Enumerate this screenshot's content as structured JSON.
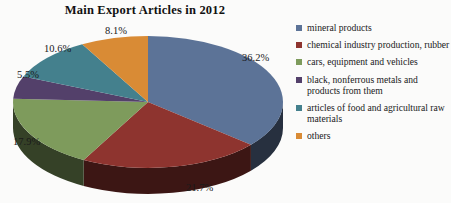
{
  "chart_data": {
    "type": "pie",
    "title": "Main Export Articles in 2012",
    "xlabel": "",
    "ylabel": "",
    "legend_position": "right",
    "three_d": true,
    "categories": [
      "mineral products",
      "chemical industry production, rubber",
      "cars, equipment and vehicles",
      "black, nonferrous metals and products from them",
      "articles of food and agricultural raw materials",
      "others"
    ],
    "values": [
      36.2,
      21.7,
      17.9,
      5.5,
      10.6,
      8.1
    ],
    "value_labels": [
      "36.2%",
      "21.7%",
      "17.9%",
      "5.5%",
      "10.6%",
      "8.1%"
    ],
    "unit": "%",
    "colors": [
      "#5c7397",
      "#8e342f",
      "#7e9b5c",
      "#53406a",
      "#44808d",
      "#d98b35"
    ]
  },
  "title": {
    "text": "Main Export Articles in 2012"
  },
  "legend": {
    "items": [
      {
        "label": "mineral products",
        "color": "#5c7397",
        "value_label": "36.2%"
      },
      {
        "label": "chemical industry production, rubber",
        "color": "#8e342f",
        "value_label": "21.7%"
      },
      {
        "label": "cars, equipment and vehicles",
        "color": "#7e9b5c",
        "value_label": "17.9%"
      },
      {
        "label": "black, nonferrous metals and products from them",
        "color": "#53406a",
        "value_label": "5.5%"
      },
      {
        "label": "articles of food and agricultural raw materials",
        "color": "#44808d",
        "value_label": "10.6%"
      },
      {
        "label": "others",
        "color": "#d98b35",
        "value_label": "8.1%"
      }
    ]
  },
  "slice_labels": [
    {
      "text": "36.2%",
      "x": 242,
      "y": 38
    },
    {
      "text": "21.7%",
      "x": 186,
      "y": 168
    },
    {
      "text": "17.9%",
      "x": 13,
      "y": 122
    },
    {
      "text": "5.5%",
      "x": 17,
      "y": 55
    },
    {
      "text": "10.6%",
      "x": 44,
      "y": 29
    },
    {
      "text": "8.1%",
      "x": 105,
      "y": 11
    }
  ]
}
